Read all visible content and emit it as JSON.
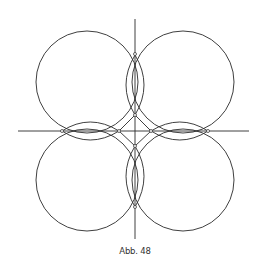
{
  "figure": {
    "caption": "Abb. 48",
    "line_color": "#2a2a2a",
    "background": "#ffffff"
  }
}
